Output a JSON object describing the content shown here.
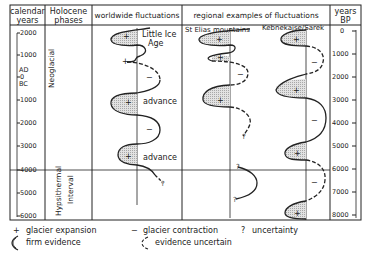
{
  "headers": {
    "calendar_years": [
      "calendar",
      "years"
    ],
    "holocene_phases": [
      "Holocene",
      "phases"
    ],
    "worldwide": "worldwide fluctuations",
    "regional": "regional examples of fluctuations",
    "years_bp": [
      "years",
      "BP"
    ]
  },
  "subheaders": {
    "st_elias": "St Elias mountains",
    "kebnekajse": "Kebnekajse/Sarek"
  },
  "calendar_axis": {
    "ticks": [
      "2000",
      "1000",
      "AD",
      "0",
      "BC",
      "1000",
      "2000",
      "3000",
      "4000",
      "5000",
      "6000"
    ]
  },
  "bp_axis": {
    "ticks": [
      "0",
      "1000",
      "2000",
      "3000",
      "4000",
      "5000",
      "6000",
      "7000",
      "8000"
    ]
  },
  "phases": {
    "neoglacial": "Neoglacial",
    "hypsithermal": [
      "Hypsithermal",
      "Interval"
    ]
  },
  "annotations": {
    "little_ice_age": [
      "Little Ice",
      "Age"
    ],
    "advance_1": "advance",
    "advance_2": "advance",
    "plus": "+",
    "minus": "−",
    "question": "?"
  },
  "legend": {
    "glacier_expansion": {
      "symbol": "+",
      "label": "glacier expansion"
    },
    "glacier_contraction": {
      "symbol": "−",
      "label": "glacier contraction"
    },
    "uncertainty": {
      "symbol": "?",
      "label": "uncertainty"
    },
    "firm_evidence": {
      "label": "firm evidence"
    },
    "evidence_uncertain": {
      "label": "evidence uncertain"
    }
  },
  "colors": {
    "line": "#222222",
    "fill": "#d4d4d4",
    "background": "#ffffff"
  }
}
